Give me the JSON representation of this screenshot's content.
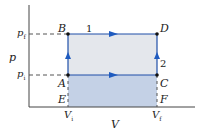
{
  "diagram": {
    "type": "pV-diagram",
    "axes": {
      "x_label": "V",
      "y_label": "p"
    },
    "ticks": {
      "x": [
        {
          "label": "V",
          "sub": "i"
        },
        {
          "label": "V",
          "sub": "f"
        }
      ],
      "y": [
        {
          "label": "p",
          "sub": "f"
        },
        {
          "label": "p",
          "sub": "i"
        }
      ]
    },
    "points": {
      "A": "A",
      "B": "B",
      "C": "C",
      "D": "D",
      "E": "E",
      "F": "F"
    },
    "paths": {
      "path1": "1",
      "path2": "2"
    },
    "colors": {
      "upper_fill": "#e4e7ec",
      "lower_fill": "#c4d1e6",
      "path_line": "#1f4fa8",
      "arrow": "#1f5bbf",
      "axis": "#444444"
    }
  }
}
